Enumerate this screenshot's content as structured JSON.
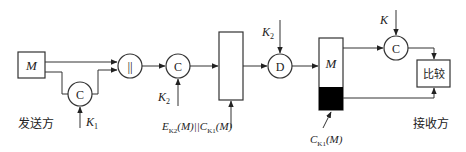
{
  "diagram": {
    "sender": {
      "label": "发送方",
      "message_box": "M",
      "mac_node": "C",
      "key": "K",
      "key_sub": "1",
      "concat_node": "||",
      "encrypt_node": "C",
      "encrypt_key": "K",
      "encrypt_key_sub": "2"
    },
    "channel": {
      "label_e": "E",
      "label_e_sub": "K2",
      "label_mid": "(M)||",
      "label_c": "C",
      "label_c_sub": "K1",
      "label_end": "(M)"
    },
    "receiver": {
      "label": "接收方",
      "decrypt_node": "D",
      "decrypt_key": "K",
      "decrypt_key_sub": "2",
      "message_box": "M",
      "mac_label_c": "C",
      "mac_label_sub": "K1",
      "mac_label_end": "(M)",
      "mac_node": "C",
      "mac_key": "K",
      "compare_box": "比较"
    },
    "colors": {
      "line": "#333333",
      "mac_fill": "#000000",
      "background": "#ffffff"
    }
  }
}
